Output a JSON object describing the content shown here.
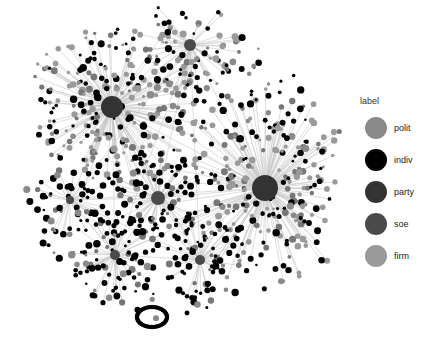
{
  "legend": {
    "title": "label",
    "items": [
      {
        "label": "polit",
        "color": "#8a8a8a"
      },
      {
        "label": "indiv",
        "color": "#000000"
      },
      {
        "label": "party",
        "color": "#333333"
      },
      {
        "label": "soe",
        "color": "#4a4a4a"
      },
      {
        "label": "firm",
        "color": "#9a9a9a"
      }
    ]
  },
  "graph": {
    "edge_color": "#c8c8c8",
    "hubs": [
      {
        "x": 112,
        "y": 107,
        "r": 11,
        "color": "#333333",
        "spokes": 180,
        "radius": 70,
        "leaf_color": "#9a9a9a"
      },
      {
        "x": 265,
        "y": 188,
        "r": 13,
        "color": "#333333",
        "spokes": 220,
        "radius": 80,
        "leaf_color": "#9a9a9a"
      },
      {
        "x": 190,
        "y": 45,
        "r": 6,
        "color": "#4a4a4a",
        "spokes": 60,
        "radius": 40,
        "leaf_color": "#9a9a9a"
      },
      {
        "x": 158,
        "y": 198,
        "r": 7,
        "color": "#4a4a4a",
        "spokes": 70,
        "radius": 35,
        "leaf_color": "#000000"
      },
      {
        "x": 115,
        "y": 255,
        "r": 5,
        "color": "#4a4a4a",
        "spokes": 60,
        "radius": 40,
        "leaf_color": "#000000"
      },
      {
        "x": 200,
        "y": 260,
        "r": 5,
        "color": "#4a4a4a",
        "spokes": 50,
        "radius": 35,
        "leaf_color": "#000000"
      },
      {
        "x": 70,
        "y": 200,
        "r": 4,
        "color": "#4a4a4a",
        "spokes": 40,
        "radius": 30,
        "leaf_color": "#000000"
      }
    ],
    "ring": {
      "x": 152,
      "y": 317,
      "rx": 15,
      "ry": 10
    }
  }
}
